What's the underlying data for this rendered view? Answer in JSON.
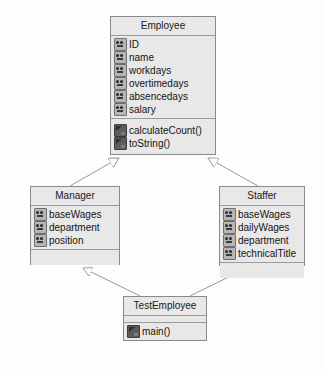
{
  "diagram": {
    "type": "uml-class-diagram",
    "background_color": "#fdfdfd",
    "box_fill_color": "#e8e8e8",
    "box_border_color": "#8a8a8a",
    "line_color": "#9a9a9a",
    "classes": [
      {
        "id": "employee",
        "name": "Employee",
        "x": 110,
        "y": 16,
        "w": 106,
        "h": 139,
        "attributes": [
          {
            "icon": "field-icon",
            "label": "ID"
          },
          {
            "icon": "field-icon",
            "label": "name"
          },
          {
            "icon": "field-icon",
            "label": "workdays"
          },
          {
            "icon": "field-icon",
            "label": "overtimedays"
          },
          {
            "icon": "field-icon",
            "label": "absencedays"
          },
          {
            "icon": "field-icon",
            "label": "salary"
          }
        ],
        "methods": [
          {
            "icon": "method-icon",
            "label": "calculateCount()"
          },
          {
            "icon": "method-icon",
            "label": "toString()"
          }
        ]
      },
      {
        "id": "manager",
        "name": "Manager",
        "x": 30,
        "y": 186,
        "w": 90,
        "h": 79,
        "attributes": [
          {
            "icon": "field-icon",
            "label": "baseWages"
          },
          {
            "icon": "field-icon",
            "label": "department"
          },
          {
            "icon": "field-icon",
            "label": "position"
          }
        ],
        "methods": []
      },
      {
        "id": "staffer",
        "name": "Staffer",
        "x": 219,
        "y": 186,
        "w": 86,
        "h": 80,
        "attributes": [
          {
            "icon": "field-icon",
            "label": "baseWages"
          },
          {
            "icon": "field-icon",
            "label": "dailyWages"
          },
          {
            "icon": "field-icon",
            "label": "department"
          },
          {
            "icon": "field-icon",
            "label": "technicalTitle"
          }
        ],
        "methods": []
      },
      {
        "id": "testemployee",
        "name": "TestEmployee",
        "x": 123,
        "y": 296,
        "w": 84,
        "h": 45,
        "attributes": [],
        "methods": [
          {
            "icon": "method-icon",
            "label": "main()"
          }
        ]
      }
    ],
    "relations": [
      {
        "id": "manager-extends-employee",
        "kind": "generalization",
        "from": "manager",
        "to": "employee",
        "arrowhead": "hollow-triangle"
      },
      {
        "id": "staffer-extends-employee",
        "kind": "generalization",
        "from": "staffer",
        "to": "employee",
        "arrowhead": "hollow-triangle"
      },
      {
        "id": "test-uses-manager",
        "kind": "generalization",
        "from": "testemployee",
        "to": "manager",
        "arrowhead": "hollow-triangle"
      },
      {
        "id": "test-uses-staffer",
        "kind": "generalization",
        "from": "testemployee",
        "to": "staffer",
        "arrowhead": "hollow-triangle"
      }
    ]
  }
}
